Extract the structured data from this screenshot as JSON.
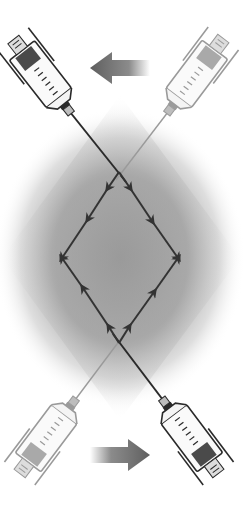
{
  "diagram": {
    "description": "Two-syringe transfer technique: syringes connected at crossing needles, flow arrows forming a diamond loop",
    "colors": {
      "background": "#ffffff",
      "glow": "#9a9a9a",
      "line": "#333333",
      "arrow_big": "#6e6e6e",
      "syringe_dark": "#2a2a2a",
      "syringe_light": "#9a9a9a",
      "plunger_dark": "#3a3a3a",
      "plunger_light": "#8a8a8a"
    },
    "syringes": [
      {
        "id": "top-left",
        "style": "dark",
        "position": "top-left"
      },
      {
        "id": "top-right",
        "style": "light",
        "position": "top-right"
      },
      {
        "id": "bottom-left",
        "style": "light",
        "position": "bottom-left"
      },
      {
        "id": "bottom-right",
        "style": "dark",
        "position": "bottom-right"
      }
    ],
    "big_arrows": [
      {
        "id": "top",
        "direction": "left"
      },
      {
        "id": "bottom",
        "direction": "right"
      }
    ],
    "diamond": {
      "top": [
        119,
        172
      ],
      "right": [
        178,
        258
      ],
      "bottom": [
        119,
        343
      ],
      "left": [
        62,
        258
      ]
    }
  }
}
